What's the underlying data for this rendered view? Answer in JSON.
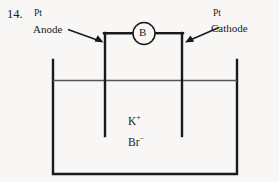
{
  "figure": {
    "question_number": "14.",
    "labels": {
      "left_material": "Pt",
      "left_electrode": "Anode",
      "right_material": "Pt",
      "right_electrode": "Cathode",
      "meter_symbol": "B"
    },
    "electrolyte": {
      "cation_symbol": "K",
      "cation_charge": "+",
      "anion_symbol": "Br",
      "anion_charge": "−"
    },
    "colors": {
      "background": "#f8f7f5",
      "line": "#1a1a1a",
      "liquid_line": "#555555",
      "text": "#1a1a1a"
    }
  }
}
